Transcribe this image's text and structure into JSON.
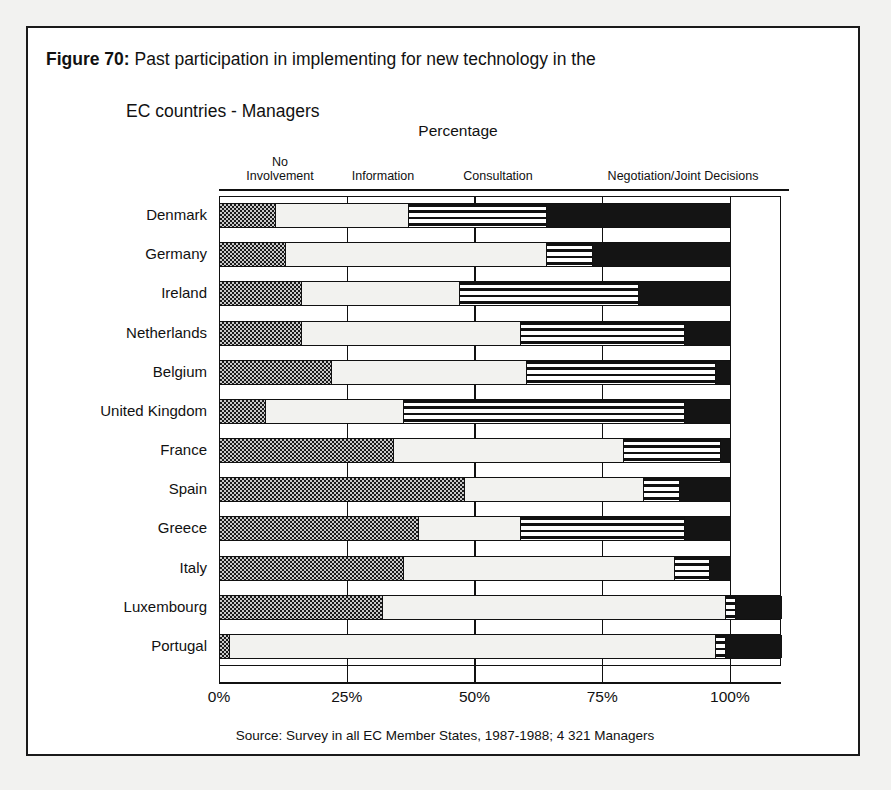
{
  "figure": {
    "number_label": "Figure 70:",
    "title_line1": "Past participation in implementing for new technology in the",
    "title_line2": "EC countries - Managers",
    "axis_title": "Percentage",
    "source": "Source: Survey in all EC Member States, 1987-1988; 4 321 Managers"
  },
  "legend": {
    "items": [
      {
        "label_line1": "No",
        "label_line2": "Involvement",
        "key": "no-involvement",
        "pattern": "checkered",
        "color": "#c9c9c9"
      },
      {
        "label_line1": "Information",
        "label_line2": "",
        "key": "information",
        "pattern": "light-stipple",
        "color": "#f2f2ef"
      },
      {
        "label_line1": "Consultation",
        "label_line2": "",
        "key": "consultation",
        "pattern": "horizontal-stripes",
        "color": "#ffffff"
      },
      {
        "label_line1": "Negotiation/Joint Decisions",
        "label_line2": "",
        "key": "negotiation",
        "pattern": "solid",
        "color": "#141414"
      }
    ]
  },
  "xaxis": {
    "ticks": [
      "0%",
      "25%",
      "50%",
      "75%",
      "100%"
    ],
    "tick_values": [
      0,
      25,
      50,
      75,
      100
    ],
    "min": 0,
    "max": 110
  },
  "chart_data": {
    "type": "bar",
    "orientation": "horizontal",
    "stacked": true,
    "normalized_percent": true,
    "title": "Past participation in implementing for new technology in the EC countries - Managers",
    "xlabel": "Percentage",
    "ylabel": "",
    "xlim": [
      0,
      110
    ],
    "grid": true,
    "legend_position": "top",
    "categories": [
      "Denmark",
      "Germany",
      "Ireland",
      "Netherlands",
      "Belgium",
      "United Kingdom",
      "France",
      "Spain",
      "Greece",
      "Italy",
      "Luxembourg",
      "Portugal"
    ],
    "series": [
      {
        "name": "No Involvement",
        "values": [
          11,
          13,
          16,
          16,
          22,
          9,
          34,
          48,
          39,
          36,
          32,
          2
        ]
      },
      {
        "name": "Information",
        "values": [
          26,
          51,
          31,
          43,
          38,
          27,
          45,
          35,
          20,
          53,
          67,
          95
        ]
      },
      {
        "name": "Consultation",
        "values": [
          27,
          9,
          35,
          32,
          37,
          55,
          19,
          7,
          32,
          7,
          2,
          2
        ]
      },
      {
        "name": "Negotiation/Joint Decisions",
        "values": [
          36,
          27,
          18,
          9,
          3,
          9,
          2,
          10,
          9,
          4,
          9,
          11
        ]
      }
    ]
  }
}
